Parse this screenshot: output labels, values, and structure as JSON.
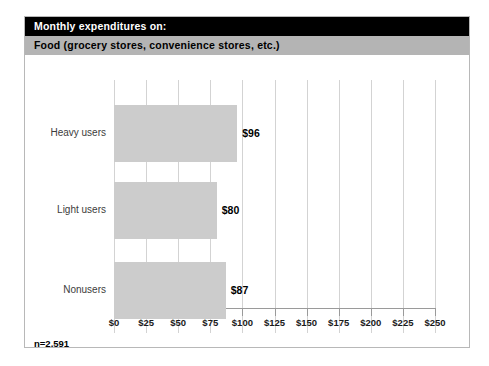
{
  "figure": {
    "title": "Monthly expenditures on:",
    "subtitle": "Food (grocery stores, convenience stores, etc.)",
    "footnote": "n=2,591",
    "colors": {
      "title_band": "#000000",
      "subtitle_band": "#b4b4b4",
      "bar_fill": "#cccccc",
      "gridline": "#d3d3d3",
      "frame": "#b8b8b8"
    }
  },
  "chart_data": {
    "type": "bar",
    "orientation": "horizontal",
    "title": "Monthly expenditures on:",
    "subtitle": "Food (grocery stores, convenience stores, etc.)",
    "categories": [
      "Heavy users",
      "Light users",
      "Nonusers"
    ],
    "values": [
      96,
      80,
      87
    ],
    "value_labels": [
      "$96",
      "$80",
      "$87"
    ],
    "xlabel": "",
    "ylabel": "",
    "xlim": [
      0,
      250
    ],
    "xticks": [
      0,
      25,
      50,
      75,
      100,
      125,
      150,
      175,
      200,
      225,
      250
    ],
    "xtick_labels": [
      "$0",
      "$25",
      "$50",
      "$75",
      "$100",
      "$125",
      "$150",
      "$175",
      "$200",
      "$225",
      "$250"
    ],
    "grid": true,
    "legend": false,
    "annotation": "n=2,591",
    "sample_size": 2591
  }
}
